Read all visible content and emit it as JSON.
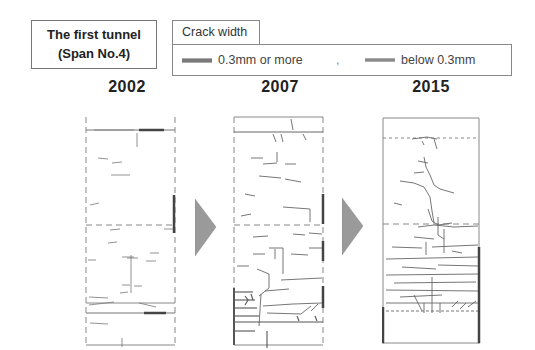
{
  "header": {
    "title_line1": "The first tunnel",
    "title_line2": "(Span No.4)"
  },
  "legend": {
    "title": "Crack width",
    "items": [
      {
        "label": "0.3mm or more",
        "line_style": "thick-gray"
      },
      {
        "label": "below 0.3mm",
        "line_style": "thin-gray"
      }
    ],
    "separator": ","
  },
  "panels": [
    {
      "year": "2002",
      "crack_density": "sparse"
    },
    {
      "year": "2007",
      "crack_density": "moderate"
    },
    {
      "year": "2015",
      "crack_density": "dense"
    }
  ],
  "arrows": [
    {
      "from": "2002",
      "to": "2007",
      "icon": "triangle-right-icon"
    },
    {
      "from": "2007",
      "to": "2015",
      "icon": "triangle-right-icon"
    }
  ],
  "colors": {
    "arrow_fill": "#9a9a9a",
    "crack_line": "#666666",
    "panel_border": "#888888"
  }
}
